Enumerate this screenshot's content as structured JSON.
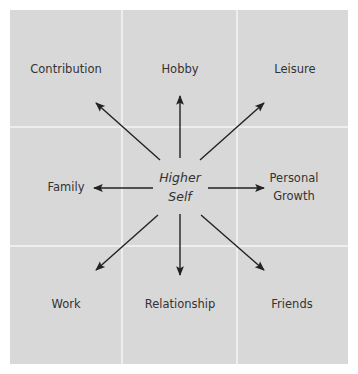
{
  "diagram": {
    "title_fragment": "",
    "center": {
      "line1": "Higher",
      "line2": "Self"
    },
    "nodes": {
      "contribution": "Contribution",
      "hobby": "Hobby",
      "leisure": "Leisure",
      "family": "Family",
      "personal_growth_1": "Personal",
      "personal_growth_2": "Growth",
      "work": "Work",
      "relationship": "Relationship",
      "friends": "Friends"
    },
    "colors": {
      "background": "#d8d8d8",
      "grid_lines": "#eeeeee",
      "text": "#333333",
      "arrows": "#222222"
    }
  }
}
